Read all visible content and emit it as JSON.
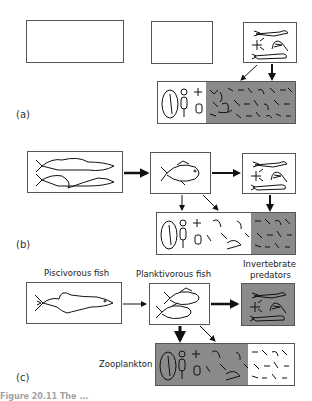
{
  "panels": [
    {
      "id": "a",
      "label": "(a)"
    },
    {
      "id": "b",
      "label": "(b)"
    },
    {
      "id": "c",
      "label": "(c)"
    }
  ],
  "nodes": {
    "piscivorous_fish": "Piscivorous fish",
    "planktivorous_fish": "Planktivorous fish",
    "invertebrate_predators_line1": "Invertebrate",
    "invertebrate_predators_line2": "predators",
    "zooplankton": "Zooplankton"
  },
  "colors": {
    "box_border": "#555555",
    "shaded_fill": "#8a8a8a",
    "arrow": "#111111"
  },
  "caption": "Figure 20.11 The ..."
}
